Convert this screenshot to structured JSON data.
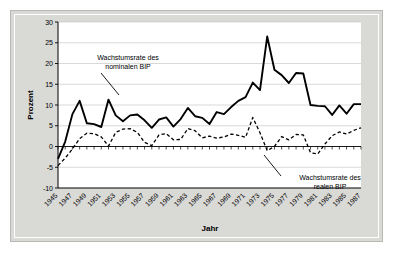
{
  "chart_data": {
    "type": "line",
    "title": "",
    "xlabel": "Jahr",
    "ylabel": "Prozent",
    "ylim": [
      -10,
      30
    ],
    "ytick_step": 5,
    "yticks": [
      "30",
      "25",
      "20",
      "15",
      "10",
      "5",
      "0",
      "-5",
      "-10"
    ],
    "xlim": [
      1945,
      1987
    ],
    "xticks": [
      "1945",
      "1947",
      "1949",
      "1951",
      "1953",
      "1955",
      "1957",
      "1959",
      "1961",
      "1963",
      "1965",
      "1967",
      "1969",
      "1971",
      "1973",
      "1975",
      "1977",
      "1979",
      "1981",
      "1983",
      "1985",
      "1987"
    ],
    "x": [
      1945,
      1946,
      1947,
      1948,
      1949,
      1950,
      1951,
      1952,
      1953,
      1954,
      1955,
      1956,
      1957,
      1958,
      1959,
      1960,
      1961,
      1962,
      1963,
      1964,
      1965,
      1966,
      1967,
      1968,
      1969,
      1970,
      1971,
      1972,
      1973,
      1974,
      1975,
      1976,
      1977,
      1978,
      1979,
      1980,
      1981,
      1982,
      1983,
      1984,
      1985,
      1986,
      1987
    ],
    "grid": true,
    "grid_axis": "y",
    "legend_position": "none",
    "series": [
      {
        "name": "Wachstumsrate des nominalen BIP",
        "style": "solid",
        "color": "#000000",
        "values": [
          -3.0,
          1.2,
          7.8,
          11.0,
          5.6,
          5.4,
          4.7,
          11.3,
          7.5,
          6.1,
          7.5,
          7.7,
          6.3,
          4.5,
          6.5,
          7.0,
          4.8,
          6.6,
          9.3,
          7.3,
          6.9,
          5.4,
          8.3,
          7.8,
          9.5,
          11.0,
          11.9,
          15.4,
          13.6,
          26.5,
          18.5,
          17.2,
          15.3,
          17.7,
          17.6,
          10.0,
          9.8,
          9.7,
          7.6,
          9.9,
          7.9,
          10.2,
          10.2
        ]
      },
      {
        "name": "Wachstumsrate des realen BIP",
        "style": "dashed",
        "color": "#000000",
        "values": [
          -4.6,
          -2.8,
          -0.6,
          1.9,
          3.2,
          3.1,
          2.3,
          0.1,
          3.4,
          4.2,
          4.3,
          3.4,
          1.0,
          0.2,
          2.8,
          3.1,
          1.6,
          1.7,
          4.3,
          3.8,
          2.1,
          2.5,
          2.0,
          2.3,
          3.0,
          2.7,
          2.2,
          7.0,
          3.3,
          -1.0,
          0.0,
          2.4,
          1.6,
          2.9,
          2.8,
          -1.5,
          -1.8,
          0.6,
          2.6,
          3.5,
          3.0,
          3.9,
          4.5
        ]
      }
    ],
    "annotations": [
      {
        "name": "nominal-annotation",
        "line1": "Wachstumsrate des",
        "line2": "nominalen BIP"
      },
      {
        "name": "real-annotation",
        "line1": "Wachstumsrate des",
        "line2": "realen BIP"
      }
    ]
  },
  "colors": {
    "plot_background": "#ffffff",
    "frame": "#d9d9d6",
    "grid": "#c9c9c9",
    "axis": "#000000",
    "series": "#000000"
  }
}
